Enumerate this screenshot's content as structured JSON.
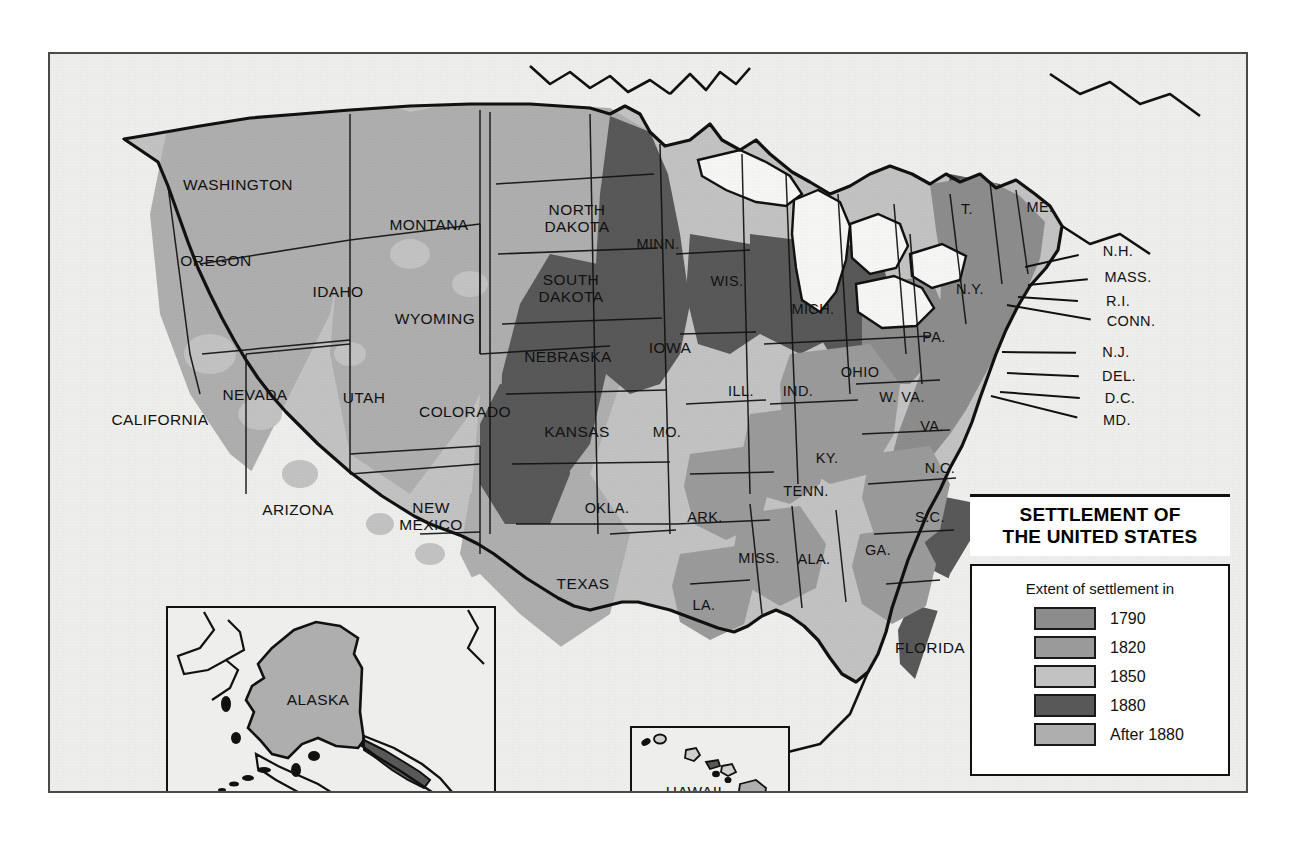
{
  "map": {
    "title_line1": "SETTLEMENT OF",
    "title_line2": "THE UNITED STATES",
    "legend_subtitle": "Extent of settlement in",
    "legend_entries": [
      {
        "label": "1790",
        "color": "#8c8c8c"
      },
      {
        "label": "1820",
        "color": "#9a9a9a"
      },
      {
        "label": "1850",
        "color": "#c2c2c2"
      },
      {
        "label": "1880",
        "color": "#585858"
      },
      {
        "label": "After 1880",
        "color": "#aeaeae"
      }
    ],
    "colors": {
      "ocean": "#eeeeec",
      "land_base": "#c2c2c2",
      "frame_border": "#4a4a4a",
      "outline": "#111111",
      "era_1790": "#8c8c8c",
      "era_1820": "#9a9a9a",
      "era_1850": "#c2c2c2",
      "era_1880": "#585858",
      "era_after_1880": "#aeaeae"
    },
    "insets": [
      {
        "name": "alaska",
        "label": "ALASKA"
      },
      {
        "name": "hawaii",
        "label": "HAWAII"
      }
    ],
    "state_labels": [
      {
        "name": "washington",
        "text": "WASHINGTON",
        "x": 188,
        "y": 131,
        "size": "big"
      },
      {
        "name": "oregon",
        "text": "OREGON",
        "x": 166,
        "y": 207,
        "size": "big"
      },
      {
        "name": "california",
        "text": "CALIFORNIA",
        "x": 110,
        "y": 366,
        "size": "big"
      },
      {
        "name": "idaho",
        "text": "IDAHO",
        "x": 288,
        "y": 238,
        "size": "big"
      },
      {
        "name": "nevada",
        "text": "NEVADA",
        "x": 205,
        "y": 341,
        "size": "big"
      },
      {
        "name": "utah",
        "text": "UTAH",
        "x": 314,
        "y": 344,
        "size": "big"
      },
      {
        "name": "arizona",
        "text": "ARIZONA",
        "x": 248,
        "y": 456,
        "size": "big"
      },
      {
        "name": "montana",
        "text": "MONTANA",
        "x": 379,
        "y": 171,
        "size": "big"
      },
      {
        "name": "wyoming",
        "text": "WYOMING",
        "x": 385,
        "y": 265,
        "size": "big"
      },
      {
        "name": "colorado",
        "text": "COLORADO",
        "x": 415,
        "y": 358,
        "size": "big"
      },
      {
        "name": "new-mexico",
        "text": "NEW\nMEXICO",
        "x": 381,
        "y": 462,
        "size": "big"
      },
      {
        "name": "north-dakota",
        "text": "NORTH\nDAKOTA",
        "x": 527,
        "y": 164,
        "size": "big"
      },
      {
        "name": "south-dakota",
        "text": "SOUTH\nDAKOTA",
        "x": 521,
        "y": 234,
        "size": "big"
      },
      {
        "name": "nebraska",
        "text": "NEBRASKA",
        "x": 518,
        "y": 303,
        "size": "big"
      },
      {
        "name": "kansas",
        "text": "KANSAS",
        "x": 527,
        "y": 378,
        "size": "big"
      },
      {
        "name": "oklahoma",
        "text": "OKLA.",
        "x": 557,
        "y": 454,
        "size": "mid"
      },
      {
        "name": "texas",
        "text": "TEXAS",
        "x": 533,
        "y": 530,
        "size": "big"
      },
      {
        "name": "minnesota",
        "text": "MINN.",
        "x": 608,
        "y": 190,
        "size": "mid"
      },
      {
        "name": "iowa",
        "text": "IOWA",
        "x": 620,
        "y": 294,
        "size": "big"
      },
      {
        "name": "missouri",
        "text": "MO.",
        "x": 617,
        "y": 378,
        "size": "mid"
      },
      {
        "name": "arkansas",
        "text": "ARK.",
        "x": 655,
        "y": 463,
        "size": "mid"
      },
      {
        "name": "louisiana",
        "text": "LA.",
        "x": 654,
        "y": 551,
        "size": "mid"
      },
      {
        "name": "wisconsin",
        "text": "WIS.",
        "x": 677,
        "y": 227,
        "size": "mid"
      },
      {
        "name": "illinois",
        "text": "ILL.",
        "x": 691,
        "y": 337,
        "size": "mid"
      },
      {
        "name": "mississippi",
        "text": "MISS.",
        "x": 709,
        "y": 504,
        "size": "mid"
      },
      {
        "name": "michigan",
        "text": "MICH.",
        "x": 763,
        "y": 255,
        "size": "mid"
      },
      {
        "name": "indiana",
        "text": "IND.",
        "x": 748,
        "y": 337,
        "size": "mid"
      },
      {
        "name": "alabama",
        "text": "ALA.",
        "x": 764,
        "y": 505,
        "size": "mid"
      },
      {
        "name": "ohio",
        "text": "OHIO",
        "x": 810,
        "y": 318,
        "size": "mid"
      },
      {
        "name": "kentucky",
        "text": "KY.",
        "x": 777,
        "y": 404,
        "size": "mid"
      },
      {
        "name": "tennessee",
        "text": "TENN.",
        "x": 756,
        "y": 437,
        "size": "mid"
      },
      {
        "name": "georgia",
        "text": "GA.",
        "x": 828,
        "y": 496,
        "size": "mid"
      },
      {
        "name": "west-virginia",
        "text": "W. VA.",
        "x": 852,
        "y": 343,
        "size": "mid"
      },
      {
        "name": "virginia",
        "text": "VA.",
        "x": 882,
        "y": 372,
        "size": "mid"
      },
      {
        "name": "north-carolina",
        "text": "N.C.",
        "x": 890,
        "y": 414,
        "size": "mid"
      },
      {
        "name": "south-carolina",
        "text": "S.C.",
        "x": 880,
        "y": 463,
        "size": "mid"
      },
      {
        "name": "florida",
        "text": "FLORIDA",
        "x": 880,
        "y": 594,
        "size": "big"
      },
      {
        "name": "pennsylvania",
        "text": "PA.",
        "x": 884,
        "y": 283,
        "size": "mid"
      },
      {
        "name": "new-york",
        "text": "N.Y.",
        "x": 920,
        "y": 235,
        "size": "mid"
      },
      {
        "name": "vermont",
        "text": "T.",
        "x": 917,
        "y": 155,
        "size": "mid"
      },
      {
        "name": "maine",
        "text": "ME.",
        "x": 990,
        "y": 153,
        "size": "mid"
      }
    ],
    "callout_labels": [
      {
        "name": "new-hampshire",
        "text": "N.H.",
        "x": 1042,
        "y": 197,
        "lx": 975,
        "ly": 212
      },
      {
        "name": "massachusetts",
        "text": "MASS.",
        "x": 1052,
        "y": 223,
        "lx": 978,
        "ly": 230
      },
      {
        "name": "rhode-island",
        "text": "R.I.",
        "x": 1042,
        "y": 247,
        "lx": 968,
        "ly": 242
      },
      {
        "name": "connecticut",
        "text": "CONN.",
        "x": 1055,
        "y": 267,
        "lx": 957,
        "ly": 250
      },
      {
        "name": "new-jersey",
        "text": "N.J.",
        "x": 1040,
        "y": 298,
        "lx": 952,
        "ly": 297
      },
      {
        "name": "delaware",
        "text": "DEL.",
        "x": 1043,
        "y": 322,
        "lx": 957,
        "ly": 318
      },
      {
        "name": "district-of-columbia",
        "text": "D.C.",
        "x": 1044,
        "y": 344,
        "lx": 950,
        "ly": 337
      },
      {
        "name": "maryland",
        "text": "MD.",
        "x": 1041,
        "y": 366,
        "lx": 941,
        "ly": 341
      }
    ]
  }
}
